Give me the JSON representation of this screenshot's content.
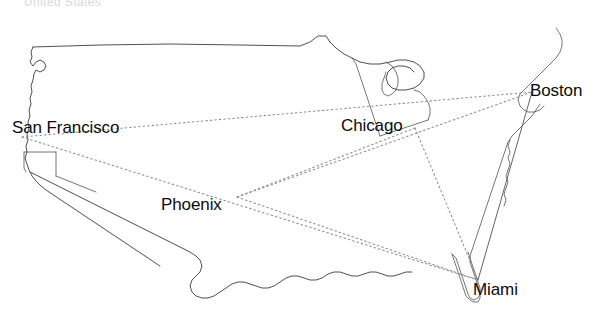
{
  "figure": {
    "kind": "us-map-network-diagram",
    "header_text_faint": "United States",
    "background_color": "#ffffff",
    "outline_color": "#3b3b3b",
    "label_color": "#0b0b0b",
    "dotted_edge_color": "#8d8d8d",
    "solid_edge_color": "#5c5c5c"
  },
  "nodes": [
    {
      "id": "san-francisco",
      "label": "San Francisco",
      "x": 22,
      "y": 137,
      "label_x": 12,
      "label_y": 119,
      "label_anchor": "left"
    },
    {
      "id": "chicago",
      "label": "Chicago",
      "x": 415,
      "y": 128,
      "label_x": 341,
      "label_y": 117,
      "label_anchor": "left"
    },
    {
      "id": "boston",
      "label": "Boston",
      "x": 532,
      "y": 92,
      "label_x": 530,
      "label_y": 82,
      "label_anchor": "left"
    },
    {
      "id": "phoenix",
      "label": "Phoenix",
      "x": 237,
      "y": 197,
      "label_x": 161,
      "label_y": 196,
      "label_anchor": "left"
    },
    {
      "id": "miami",
      "label": "Miami",
      "x": 478,
      "y": 280,
      "label_x": 473,
      "label_y": 281,
      "label_anchor": "left"
    }
  ],
  "edges": [
    {
      "from": "san-francisco",
      "to": "boston",
      "style": "dotted"
    },
    {
      "from": "san-francisco",
      "to": "miami",
      "style": "dotted"
    },
    {
      "from": "chicago",
      "to": "phoenix",
      "style": "dotted"
    },
    {
      "from": "chicago",
      "to": "miami",
      "style": "dotted"
    },
    {
      "from": "phoenix",
      "to": "boston",
      "style": "dotted"
    },
    {
      "from": "phoenix",
      "to": "miami",
      "style": "dotted"
    },
    {
      "from": "boston",
      "to": "miami",
      "style": "solid"
    }
  ]
}
